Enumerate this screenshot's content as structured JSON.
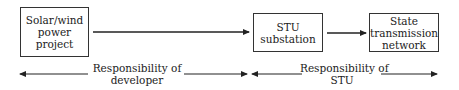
{
  "diagram": {
    "nodes": [
      {
        "id": "solar",
        "lines": [
          "Solar/wind",
          "power",
          "project"
        ]
      },
      {
        "id": "stu_substation",
        "lines": [
          "STU",
          "substation"
        ]
      },
      {
        "id": "state_network",
        "lines": [
          "State",
          "transmission",
          "network"
        ]
      }
    ],
    "edges": [
      {
        "from": "solar",
        "to": "stu_substation"
      },
      {
        "from": "stu_substation",
        "to": "state_network"
      }
    ],
    "responsibilities": [
      {
        "id": "developer",
        "lines": [
          "Responsibility of",
          "developer"
        ]
      },
      {
        "id": "stu",
        "lines": [
          "Responsibility of",
          "STU"
        ]
      }
    ],
    "colors": {
      "stroke": "#222222",
      "background": "#ffffff"
    }
  }
}
